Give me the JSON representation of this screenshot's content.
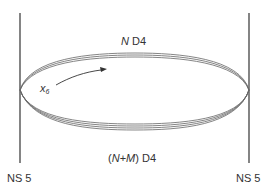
{
  "diagram": {
    "title": "",
    "branes": {
      "ns5_left": {
        "label": "NS 5"
      },
      "ns5_right": {
        "label": "NS 5"
      }
    },
    "d4_stacks": {
      "top": {
        "label_italic": "N",
        "label_rest": " D4",
        "line_count": 3
      },
      "bottom": {
        "label_open": "(",
        "label_italic_n": "N",
        "label_plus": "+",
        "label_italic_m": "M",
        "label_close": ") D4",
        "line_count": 4
      }
    },
    "coordinate": {
      "symbol": "x",
      "subscript": "6",
      "direction": "arrow-right"
    },
    "colors": {
      "line": "#333333",
      "ellipse": "#555555",
      "text": "#333333",
      "background": "#ffffff"
    }
  }
}
